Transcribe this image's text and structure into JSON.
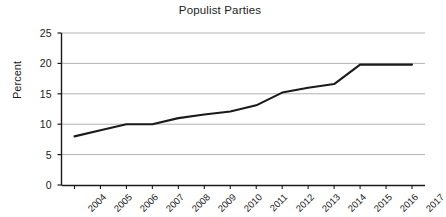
{
  "chart_data": {
    "type": "line",
    "title": "Populist Parties",
    "xlabel": "",
    "ylabel": "Percent",
    "categories": [
      "2004",
      "2005",
      "2006",
      "2007",
      "2008",
      "2009",
      "2010",
      "2011",
      "2012",
      "2013",
      "2014",
      "2015",
      "2016",
      "2017"
    ],
    "values": [
      8.0,
      9.0,
      10.0,
      10.0,
      11.0,
      11.6,
      12.1,
      13.1,
      15.2,
      16.0,
      16.6,
      19.8,
      19.8,
      19.8
    ],
    "series": [
      {
        "name": "Populist Parties",
        "values": [
          8.0,
          9.0,
          10.0,
          10.0,
          11.0,
          11.6,
          12.1,
          13.1,
          15.2,
          16.0,
          16.6,
          19.8,
          19.8,
          19.8
        ],
        "color": "#1a1a1a"
      }
    ],
    "ylim": [
      0,
      25
    ],
    "yticks": [
      0,
      5,
      10,
      15,
      20,
      25
    ],
    "ytick_labels": [
      "0",
      "5",
      "10",
      "15",
      "20",
      "25"
    ],
    "xtick_labels": [
      "2004",
      "2005",
      "2006",
      "2007",
      "2008",
      "2009",
      "2010",
      "2011",
      "2012",
      "2013",
      "2014",
      "2015",
      "2016",
      "2017"
    ],
    "grid": "horizontal",
    "gridline_color": "#aaaaaa",
    "legend": "none",
    "axis_color": "#1a1a1a",
    "line_color": "#1a1a1a",
    "background": "#ffffff"
  }
}
